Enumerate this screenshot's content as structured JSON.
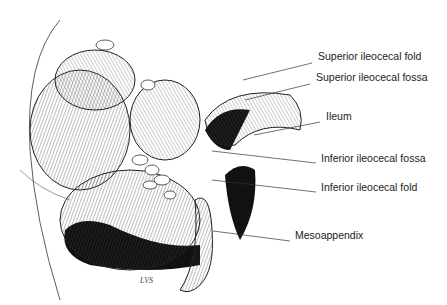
{
  "figure": {
    "signature": "LVS",
    "labels": [
      {
        "text": "Superior ileocecal fold",
        "x": 318,
        "y": 56,
        "line": [
          243,
          80,
          312,
          63
        ]
      },
      {
        "text": "Superior ileocecal fossa",
        "x": 316,
        "y": 77,
        "line": [
          245,
          100,
          310,
          84
        ]
      },
      {
        "text": "Ileum",
        "x": 326,
        "y": 116,
        "line": [
          254,
          135,
          320,
          122
        ]
      },
      {
        "text": "Inferior ileocecal fossa",
        "x": 321,
        "y": 158,
        "line": [
          212,
          151,
          316,
          163
        ]
      },
      {
        "text": "Inferior ileocecal fold",
        "x": 321,
        "y": 187,
        "line": [
          212,
          180,
          316,
          192
        ]
      },
      {
        "text": "Mesoappendix",
        "x": 295,
        "y": 235,
        "line": [
          213,
          231,
          290,
          241
        ]
      }
    ]
  }
}
